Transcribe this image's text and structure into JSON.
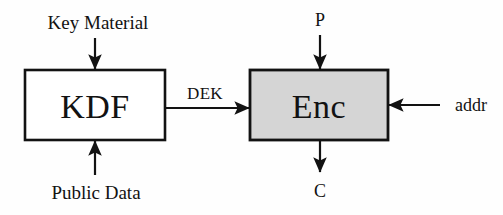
{
  "diagram": {
    "background_color": "#fefefe",
    "stroke_color": "#121212",
    "blocks": [
      {
        "id": "kdf",
        "label": "KDF",
        "fill": "#ffffff",
        "x": 25,
        "y": 70,
        "width": 140,
        "height": 70
      },
      {
        "id": "enc",
        "label": "Enc",
        "fill": "#d5d5d5",
        "x": 250,
        "y": 70,
        "width": 138,
        "height": 70
      }
    ],
    "inputs": {
      "key_material": "Key Material",
      "public_data": "Public Data",
      "plaintext": "P",
      "address": "addr"
    },
    "outputs": {
      "ciphertext": "C"
    },
    "edges": {
      "dek": "DEK"
    }
  }
}
